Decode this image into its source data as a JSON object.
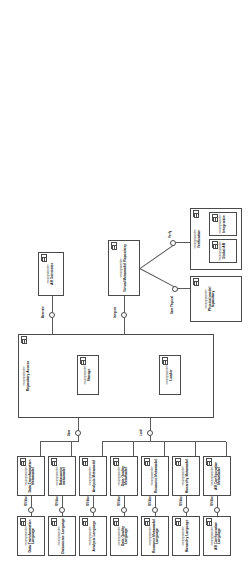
{
  "diagram": {
    "type": "uml-component-diagram",
    "stereotype_component": "<<component>>",
    "orientation": "landscape-rotated"
  },
  "components": [
    {
      "id": "data_transformation_language",
      "name": "Data Transformation Language",
      "stereotype": "<<component>>"
    },
    {
      "id": "data_transformation_metamodel",
      "name": "Data Transformation Metamodel",
      "stereotype": "<<component>>"
    },
    {
      "id": "datasource_language",
      "name": "Datasource Language",
      "stereotype": "<<component>>"
    },
    {
      "id": "datasource_metamodel",
      "name": "Datasource metamodel",
      "stereotype": "<<component>>"
    },
    {
      "id": "analysis_language",
      "name": "Analysis Language",
      "stereotype": "<<component>>"
    },
    {
      "id": "analysis_metamodel",
      "name": "Analysis Metamodel",
      "stereotype": "<<component>>"
    },
    {
      "id": "data_quality_language",
      "name": "Data Quality Language",
      "stereotype": "<<component>>"
    },
    {
      "id": "data_quality_metamodel",
      "name": "Data Quality Metamodel",
      "stereotype": "<<component>>"
    },
    {
      "id": "resource_metamodel_language",
      "name": "Resource Metamodel Language",
      "stereotype": "<<component>>"
    },
    {
      "id": "resource_metamodel",
      "name": "Resource Metamodel",
      "stereotype": "<<component>>"
    },
    {
      "id": "hierarchy_language",
      "name": "Hierarchy Language",
      "stereotype": "<<component>>"
    },
    {
      "id": "hierarchy_metamodel",
      "name": "Hierarchy Metamodel",
      "stereotype": "<<component>>"
    },
    {
      "id": "ab_configuration_language",
      "name": "AB Configuration Language",
      "stereotype": "<<component>>"
    },
    {
      "id": "ab_configuration_metamodel",
      "name": "AB Configuration Metamodel",
      "stereotype": "<<component>>"
    },
    {
      "id": "repository_access",
      "name": "Repository Access",
      "stereotype": "<<component>>"
    },
    {
      "id": "storage",
      "name": "Storage",
      "stereotype": "<<component>>"
    },
    {
      "id": "loader",
      "name": "Loader",
      "stereotype": "<<component>>"
    },
    {
      "id": "ab_generator",
      "name": "AB Generator",
      "stereotype": "<<component>>"
    },
    {
      "id": "virtual_metamodel_repository",
      "name": "Virtual Metamodel Repository",
      "stereotype": "<<component>>"
    },
    {
      "id": "verification",
      "name": "Verification",
      "stereotype": "<<component>>"
    },
    {
      "id": "global_ab",
      "name": "Global AB",
      "stereotype": "<<component>>"
    },
    {
      "id": "integration",
      "name": "Integration",
      "stereotype": "<<component>>"
    },
    {
      "id": "physical_model_repository",
      "name": "Physical model repository",
      "stereotype": "<<component>>"
    }
  ],
  "interfaces": [
    {
      "id": "mm_access_dt",
      "name": "MM Access"
    },
    {
      "id": "mm_access_ds",
      "name": "MM Access"
    },
    {
      "id": "mm_access_an",
      "name": "MM Access"
    },
    {
      "id": "mm_access_dq",
      "name": "MM Access"
    },
    {
      "id": "mm_access_rm",
      "name": "MM Access"
    },
    {
      "id": "mm_access_hi",
      "name": "MM Access"
    },
    {
      "id": "mm_access_ab",
      "name": "MM Access"
    },
    {
      "id": "save",
      "name": "Save"
    },
    {
      "id": "load",
      "name": "Load"
    },
    {
      "id": "generate",
      "name": "Generate"
    },
    {
      "id": "integrate",
      "name": "Integrate"
    },
    {
      "id": "verify",
      "name": "Verify"
    },
    {
      "id": "save_physical",
      "name": "Save Physical"
    }
  ]
}
